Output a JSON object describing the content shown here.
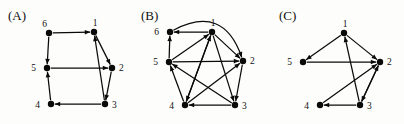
{
  "figure": {
    "width": 404,
    "height": 124,
    "background": "#fdfdfb",
    "ink_color": "#0a0a0a",
    "panels": [
      {
        "id": "A",
        "label": "(A)",
        "label_position": {
          "x": 8,
          "y": 8
        },
        "node_radius": 3.2,
        "nodes": [
          {
            "id": "1",
            "label": "1",
            "x": 94,
            "y": 32,
            "label_dx": 1,
            "label_dy": -6
          },
          {
            "id": "2",
            "label": "2",
            "x": 112,
            "y": 68,
            "label_dx": 7,
            "label_dy": 3
          },
          {
            "id": "3",
            "label": "3",
            "x": 105,
            "y": 104,
            "label_dx": 7,
            "label_dy": 4
          },
          {
            "id": "4",
            "label": "4",
            "x": 51,
            "y": 104,
            "label_dx": -11,
            "label_dy": 4
          },
          {
            "id": "5",
            "label": "5",
            "x": 47,
            "y": 68,
            "label_dx": -11,
            "label_dy": 3
          },
          {
            "id": "6",
            "label": "6",
            "x": 49,
            "y": 33,
            "label_dx": -2,
            "label_dy": -6
          }
        ],
        "edges": [
          {
            "from": "6",
            "to": "1",
            "kind": "straight",
            "arrow": true
          },
          {
            "from": "6",
            "to": "5",
            "kind": "straight",
            "arrow": true
          },
          {
            "from": "1",
            "to": "2",
            "kind": "straight",
            "arrow": true
          },
          {
            "from": "2",
            "to": "3",
            "kind": "straight",
            "arrow": true
          },
          {
            "from": "3",
            "to": "4",
            "kind": "straight",
            "arrow": true
          },
          {
            "from": "4",
            "to": "5",
            "kind": "straight",
            "arrow": true
          },
          {
            "from": "5",
            "to": "2",
            "kind": "straight",
            "arrow": true
          },
          {
            "from": "3",
            "to": "1",
            "kind": "straight",
            "arrow": true
          }
        ]
      },
      {
        "id": "B",
        "label": "(B)",
        "label_position": {
          "x": 6,
          "y": 8
        },
        "node_radius": 3.2,
        "nodes": [
          {
            "id": "1",
            "label": "1",
            "x": 77,
            "y": 32,
            "label_dx": 1,
            "label_dy": -6
          },
          {
            "id": "2",
            "label": "2",
            "x": 108,
            "y": 61,
            "label_dx": 7,
            "label_dy": 3
          },
          {
            "id": "3",
            "label": "3",
            "x": 100,
            "y": 105,
            "label_dx": 7,
            "label_dy": 4
          },
          {
            "id": "4",
            "label": "4",
            "x": 50,
            "y": 105,
            "label_dx": -11,
            "label_dy": 4
          },
          {
            "id": "5",
            "label": "5",
            "x": 34,
            "y": 62,
            "label_dx": -11,
            "label_dy": 3
          },
          {
            "id": "6",
            "label": "6",
            "x": 35,
            "y": 32,
            "label_dx": -11,
            "label_dy": 3
          }
        ],
        "edges": [
          {
            "from": "1",
            "to": "6",
            "kind": "straight",
            "arrow": true
          },
          {
            "from": "5",
            "to": "6",
            "kind": "straight",
            "arrow": true
          },
          {
            "from": "5",
            "to": "1",
            "kind": "straight",
            "arrow": true
          },
          {
            "from": "5",
            "to": "2",
            "kind": "straight",
            "arrow": true
          },
          {
            "from": "1",
            "to": "2",
            "kind": "straight",
            "arrow": true
          },
          {
            "from": "6",
            "to": "2",
            "kind": "curved",
            "curvature": -46,
            "arrow": true
          },
          {
            "from": "1",
            "to": "3",
            "kind": "straight",
            "arrow": true
          },
          {
            "from": "1",
            "to": "4",
            "kind": "straight",
            "arrow": true
          },
          {
            "from": "4",
            "to": "1",
            "kind": "straight",
            "arrow": true
          },
          {
            "from": "3",
            "to": "4",
            "kind": "straight",
            "arrow": true
          },
          {
            "from": "4",
            "to": "2",
            "kind": "straight",
            "arrow": true
          },
          {
            "from": "3",
            "to": "5",
            "kind": "straight",
            "arrow": true
          },
          {
            "from": "4",
            "to": "5",
            "kind": "straight",
            "arrow": true
          },
          {
            "from": "2",
            "to": "3",
            "kind": "straight",
            "arrow": true
          }
        ]
      },
      {
        "id": "C",
        "label": "(C)",
        "label_position": {
          "x": 10,
          "y": 8
        },
        "node_radius": 3.2,
        "nodes": [
          {
            "id": "1",
            "label": "1",
            "x": 75,
            "y": 33,
            "label_dx": 1,
            "label_dy": -6
          },
          {
            "id": "2",
            "label": "2",
            "x": 111,
            "y": 62,
            "label_dx": 7,
            "label_dy": 3
          },
          {
            "id": "3",
            "label": "3",
            "x": 91,
            "y": 105,
            "label_dx": 7,
            "label_dy": 4
          },
          {
            "id": "4",
            "label": "4",
            "x": 51,
            "y": 105,
            "label_dx": -11,
            "label_dy": 4
          },
          {
            "id": "5",
            "label": "5",
            "x": 34,
            "y": 62,
            "label_dx": -11,
            "label_dy": 3
          }
        ],
        "edges": [
          {
            "from": "1",
            "to": "5",
            "kind": "straight",
            "arrow": true
          },
          {
            "from": "1",
            "to": "2",
            "kind": "straight",
            "arrow": true
          },
          {
            "from": "5",
            "to": "2",
            "kind": "straight",
            "arrow": true
          },
          {
            "from": "3",
            "to": "1",
            "kind": "straight",
            "arrow": true
          },
          {
            "from": "3",
            "to": "2",
            "kind": "straight",
            "arrow": true
          },
          {
            "from": "2",
            "to": "3",
            "kind": "straight",
            "arrow": true
          },
          {
            "from": "3",
            "to": "4",
            "kind": "straight",
            "arrow": true
          },
          {
            "from": "4",
            "to": "2",
            "kind": "straight",
            "arrow": true
          }
        ]
      }
    ]
  }
}
